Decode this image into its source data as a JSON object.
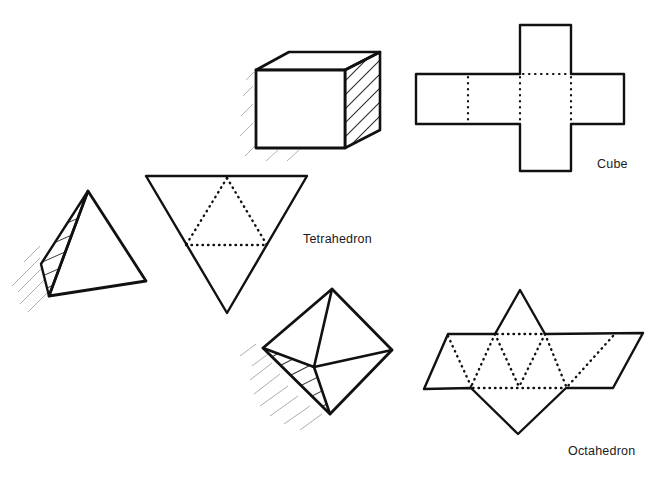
{
  "page": {
    "background_color": "#ffffff",
    "ink_color": "#111111",
    "width": 670,
    "height": 482
  },
  "labels": {
    "cube": "Cube",
    "tetrahedron": "Tetrahedron",
    "octahedron": "Octahedron"
  },
  "figures": {
    "cube_solid": {
      "name": "cube-solid",
      "kind": "3d-sketch",
      "description": "Shaded perspective cube with hatched right face",
      "front_face": [
        [
          256,
          70
        ],
        [
          345,
          70
        ],
        [
          345,
          148
        ],
        [
          256,
          148
        ]
      ],
      "top_face": [
        [
          256,
          70
        ],
        [
          289,
          52
        ],
        [
          380,
          52
        ],
        [
          345,
          70
        ]
      ],
      "right_face": [
        [
          345,
          70
        ],
        [
          380,
          52
        ],
        [
          380,
          130
        ],
        [
          345,
          148
        ]
      ],
      "hatched_face": "right",
      "shadow_strokes": 7
    },
    "cube_net": {
      "name": "cube-net",
      "kind": "net",
      "squares": 6,
      "solid_outline": true,
      "fold_lines_style": "dotted",
      "strip_left": 416,
      "strip_right": 624,
      "strip_top": 74,
      "strip_bottom": 124,
      "column_left": 520,
      "column_right": 571,
      "top_square_top": 25,
      "bottom_square_bottom": 171
    },
    "tetrahedron_solid": {
      "name": "tetrahedron-solid",
      "kind": "3d-sketch",
      "description": "Shaded perspective tetrahedron with hatched left face",
      "apex": [
        88,
        191
      ],
      "front_right": [
        146,
        281
      ],
      "bottom": [
        49,
        296
      ],
      "back_left": [
        41,
        264
      ],
      "hatched_face": "left",
      "shadow_strokes": 6
    },
    "tetrahedron_net": {
      "name": "tetrahedron-net",
      "kind": "net",
      "triangles": 4,
      "outer_triangle": [
        [
          146,
          176
        ],
        [
          307,
          176
        ],
        [
          227,
          313
        ]
      ],
      "inner_triangle_dotted": [
        [
          186,
          245
        ],
        [
          267,
          245
        ],
        [
          227,
          176
        ]
      ],
      "orientation": "point-down",
      "fold_lines_style": "dotted"
    },
    "octahedron_solid": {
      "name": "octahedron-solid",
      "kind": "3d-sketch",
      "description": "Shaded perspective octahedron with hatched lower-left face",
      "top": [
        332,
        289
      ],
      "left": [
        263,
        348
      ],
      "right": [
        392,
        350
      ],
      "bottom": [
        330,
        414
      ],
      "center": [
        314,
        367
      ],
      "hatched_face": "lower-left",
      "shadow_strokes": 8
    },
    "octahedron_net": {
      "name": "octahedron-net",
      "kind": "net",
      "triangles": 8,
      "strip_top": 334,
      "strip_bottom": 389,
      "top_left": [
        448,
        334
      ],
      "top_right": [
        643,
        333
      ],
      "bottom_left": [
        424,
        389
      ],
      "bottom_right": [
        613,
        388
      ],
      "upper_apex": [
        520,
        290
      ],
      "lower_apex": [
        518,
        434
      ],
      "fold_lines_style": "dotted"
    }
  }
}
